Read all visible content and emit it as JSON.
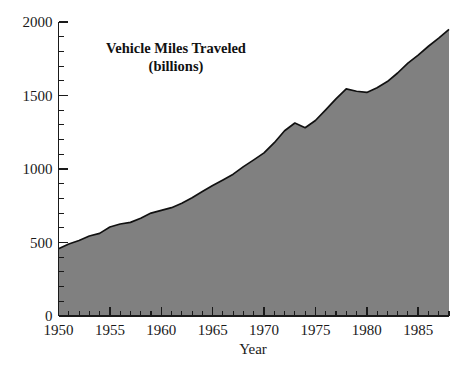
{
  "chart_data": {
    "type": "area",
    "title": "Vehicle Miles Traveled",
    "subtitle": "(billions)",
    "xlabel": "Year",
    "ylabel": "",
    "xlim": [
      1950,
      1988
    ],
    "ylim": [
      0,
      2000
    ],
    "grid": false,
    "legend": null,
    "fill_color": "#808080",
    "line_color": "#111111",
    "y_ticks_major": [
      0,
      500,
      1000,
      1500,
      2000
    ],
    "y_tick_labels": [
      "0",
      "500",
      "1000",
      "1500",
      "2000"
    ],
    "y_minor_step": 100,
    "x_ticks_major": [
      1950,
      1955,
      1960,
      1965,
      1970,
      1975,
      1980,
      1985
    ],
    "x_tick_labels": [
      "1950",
      "1955",
      "1960",
      "1965",
      "1970",
      "1975",
      "1980",
      "1985"
    ],
    "x_minor_step": 1,
    "series": [
      {
        "name": "Vehicle Miles Traveled",
        "x": [
          1950,
          1951,
          1952,
          1953,
          1954,
          1955,
          1956,
          1957,
          1958,
          1959,
          1960,
          1961,
          1962,
          1963,
          1964,
          1965,
          1966,
          1967,
          1968,
          1969,
          1970,
          1971,
          1972,
          1973,
          1974,
          1975,
          1976,
          1977,
          1978,
          1979,
          1980,
          1981,
          1982,
          1983,
          1984,
          1985,
          1986,
          1987,
          1988
        ],
        "values": [
          458,
          490,
          514,
          544,
          562,
          605,
          626,
          637,
          665,
          700,
          719,
          737,
          767,
          805,
          847,
          888,
          926,
          965,
          1016,
          1062,
          1110,
          1179,
          1260,
          1313,
          1281,
          1330,
          1402,
          1477,
          1545,
          1529,
          1521,
          1553,
          1595,
          1653,
          1720,
          1775,
          1835,
          1890,
          1950
        ]
      }
    ]
  },
  "labels": {
    "title_line1": "Vehicle Miles Traveled",
    "title_line2": "(billions)",
    "xlabel": "Year",
    "y0": "0",
    "y500": "500",
    "y1000": "1000",
    "y1500": "1500",
    "y2000": "2000",
    "x1950": "1950",
    "x1955": "1955",
    "x1960": "1960",
    "x1965": "1965",
    "x1970": "1970",
    "x1975": "1975",
    "x1980": "1980",
    "x1985": "1985"
  }
}
